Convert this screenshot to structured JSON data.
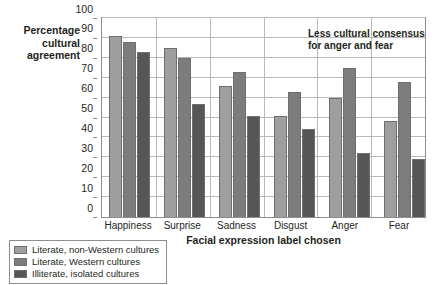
{
  "chart_data": {
    "type": "bar",
    "title": "",
    "ylabel": "Percentage cultural agreement",
    "xlabel": "Facial expression label chosen",
    "ylim": [
      0,
      100
    ],
    "ytick_step": 10,
    "yticks": [
      0,
      10,
      20,
      30,
      40,
      50,
      60,
      70,
      80,
      90,
      100
    ],
    "grid": true,
    "legend_position": "bottom-left",
    "categories": [
      "Happiness",
      "Surprise",
      "Sadness",
      "Disgust",
      "Anger",
      "Fear"
    ],
    "series": [
      {
        "name": "Literate, non-Western cultures",
        "color": "#9e9e9e",
        "values": [
          91,
          85,
          66,
          51,
          60,
          48
        ]
      },
      {
        "name": "Literate, Western cultures",
        "color": "#7c7c7c",
        "values": [
          88,
          80,
          73,
          63,
          75,
          68
        ]
      },
      {
        "name": "Illiterate, isolated cultures",
        "color": "#565656",
        "values": [
          83,
          57,
          51,
          44,
          32,
          29
        ]
      }
    ],
    "annotations": [
      {
        "text": "Less cultural consensus for anger and fear"
      }
    ]
  },
  "axis": {
    "y_title": "Percentage\ncultural\nagreement",
    "x_title": "Facial expression label chosen"
  },
  "annotation": {
    "line1": "Less cultural consensus",
    "line2": "for anger and fear"
  },
  "legend": {
    "items": [
      {
        "label": "Literate, non-Western cultures",
        "color": "#9e9e9e"
      },
      {
        "label": "Literate, Western cultures",
        "color": "#7c7c7c"
      },
      {
        "label": "Illiterate, isolated cultures",
        "color": "#565656"
      }
    ]
  },
  "colors": {
    "plot_border": "#8d8d8d",
    "gridline": "#b9b9b9",
    "bar_outline": "#6f6f6f",
    "text": "#231f20",
    "background": "#ffffff"
  }
}
